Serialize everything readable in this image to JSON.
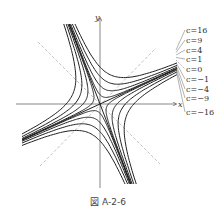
{
  "figure": {
    "caption": "図 A-2-6",
    "axis_x_label": "x",
    "axis_y_label": "y"
  },
  "chart_data": {
    "type": "contour",
    "title": "",
    "xlabel": "x",
    "ylabel": "y",
    "levels": [
      16,
      9,
      4,
      1,
      0,
      -1,
      -4,
      -9,
      -16
    ],
    "level_labels": [
      "c=16",
      "c=9",
      "c=4",
      "c=1",
      "c=0",
      "c=−1",
      "c=−4",
      "c=−9",
      "c=−16"
    ],
    "dashed_lines": [
      "y = x",
      "y = -x"
    ],
    "grid": false
  },
  "colors": {
    "curve": "#222222",
    "axis": "#555555",
    "dashed": "#888888",
    "label": "#333333"
  }
}
